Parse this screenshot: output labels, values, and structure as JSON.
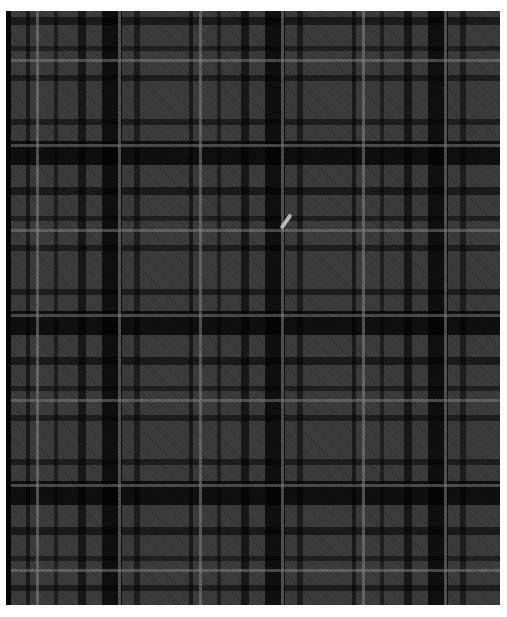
{
  "image": {
    "description": "grey and black tartan plaid fabric texture",
    "colors": {
      "base": "#3e3e3e",
      "dark_stripe": "#050505",
      "light_line": "#8c8c8c",
      "background": "#ffffff",
      "mark": "#b9b9b9"
    },
    "marks": [
      {
        "name": "light-slash-mark",
        "x": 287,
        "y": 222
      }
    ]
  }
}
